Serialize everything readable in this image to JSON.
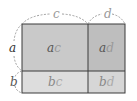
{
  "diagram": {
    "type": "area-model",
    "dimensions": {
      "width_segments": [
        "c",
        "d"
      ],
      "height_segments": [
        "a",
        "b"
      ]
    },
    "cells": [
      {
        "label_var1": "a",
        "label_var2": "c",
        "row": 0,
        "col": 0,
        "color": "#c9c9c9"
      },
      {
        "label_var1": "a",
        "label_var2": "d",
        "row": 0,
        "col": 1,
        "color": "#bebebe"
      },
      {
        "label_var1": "b",
        "label_var2": "c",
        "row": 1,
        "col": 0,
        "color": "#dddddd"
      },
      {
        "label_var1": "b",
        "label_var2": "d",
        "row": 1,
        "col": 1,
        "color": "#d6d6d6"
      }
    ],
    "colors": {
      "border": "#3a3a3a",
      "dim_text": "#9a9a9a",
      "side_text": "#333333",
      "cell_text_dark": "#555555",
      "cell_text_light": "#999999",
      "brace": "#888888"
    }
  }
}
